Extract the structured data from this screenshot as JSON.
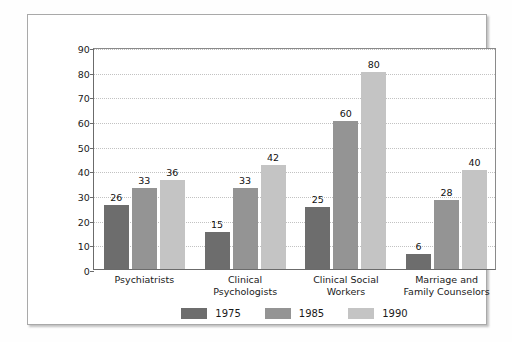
{
  "chart_data": {
    "type": "bar",
    "title": "",
    "subtitle": "",
    "xlabel": "",
    "ylabel": "",
    "ylim": [
      0,
      90
    ],
    "ytick_step": 10,
    "yticks": [
      0,
      10,
      20,
      30,
      40,
      50,
      60,
      70,
      80,
      90
    ],
    "grid": true,
    "grid_orientation": "horizontal",
    "legend_position": "bottom-center",
    "categories": [
      "Psychiatrists",
      "Clinical Psychologists",
      "Clinical Social Workers",
      "Marriage and Family Counselors"
    ],
    "category_lines": [
      [
        "Psychiatrists"
      ],
      [
        "Clinical",
        "Psychologists"
      ],
      [
        "Clinical Social",
        "Workers"
      ],
      [
        "Marriage and",
        "Family Counselors"
      ]
    ],
    "series": [
      {
        "name": "1975",
        "color": "#6d6d6d",
        "values": [
          26,
          15,
          25,
          6
        ]
      },
      {
        "name": "1985",
        "color": "#949494",
        "values": [
          33,
          33,
          60,
          28
        ]
      },
      {
        "name": "1990",
        "color": "#c4c4c4",
        "values": [
          36,
          42,
          80,
          40
        ]
      }
    ]
  },
  "legend": {
    "items": [
      {
        "label": "1975",
        "color": "#6d6d6d"
      },
      {
        "label": "1985",
        "color": "#949494"
      },
      {
        "label": "1990",
        "color": "#c4c4c4"
      }
    ]
  },
  "colors": {
    "frame_border": "#a9a9a9",
    "axis": "#6b6b6b",
    "gridline": "#c2c2c2",
    "background": "#ffffff",
    "text": "#1a1a1a"
  }
}
